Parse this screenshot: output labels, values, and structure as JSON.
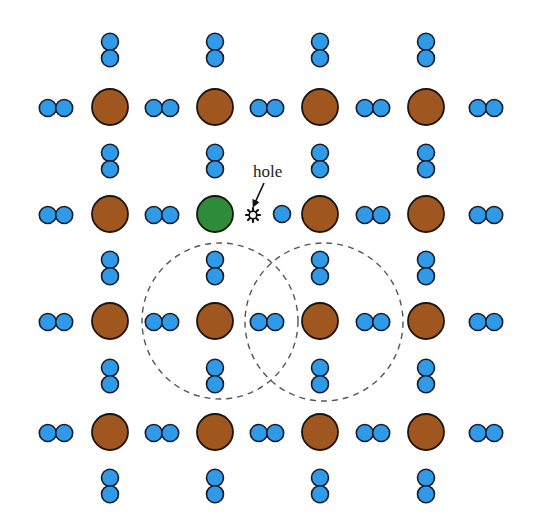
{
  "diagram": {
    "colors": {
      "host_atom": "#a0571f",
      "acceptor_atom": "#2e8b3a",
      "electron": "#2f9be8",
      "outline": "#1a1a2a",
      "dashed_circle": "#555555"
    },
    "atom_columns_x": [
      110,
      215,
      320,
      426
    ],
    "atom_rows_y": [
      107,
      214,
      321,
      432
    ],
    "atom_radius": 18,
    "electron_radius": 8.5,
    "horizontal_pair_centers_x": [
      56,
      162,
      267,
      373,
      486
    ],
    "vertical_pair_centers_y": [
      50,
      161,
      268,
      376,
      486
    ],
    "acceptor_atom": {
      "row": 1,
      "col": 1
    },
    "hole": {
      "label": "hole",
      "x": 253,
      "y": 215,
      "label_x": 253,
      "label_y": 177,
      "arrow_from": [
        264,
        183
      ],
      "arrow_to": [
        254,
        205
      ],
      "single_electron_x": 282
    },
    "dashed_circles": [
      {
        "cx": 220,
        "cy": 321,
        "r": 78
      },
      {
        "cx": 324,
        "cy": 322,
        "r": 79
      }
    ]
  }
}
